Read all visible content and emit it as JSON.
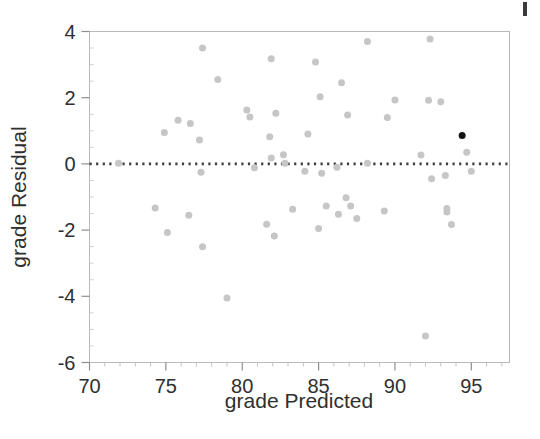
{
  "chart_data": {
    "type": "scatter",
    "title": "",
    "xlabel": "grade Predicted",
    "ylabel": "grade Residual",
    "xlim": [
      70,
      97.5
    ],
    "ylim": [
      -6,
      4
    ],
    "xticks": [
      70,
      75,
      80,
      85,
      90,
      95
    ],
    "xtick_labels": [
      "70",
      "75",
      "80",
      "85",
      "90",
      "95"
    ],
    "yticks": [
      -6,
      -4,
      -2,
      0,
      2,
      4
    ],
    "ytick_labels": [
      "-6",
      "-4",
      "-2",
      "0",
      "2",
      "4"
    ],
    "x_minor_tick_step": 1,
    "y_minor_tick_step": 0.5,
    "grid": false,
    "legend": null,
    "reference_line": {
      "kind": "horizontal-dotted",
      "y": 0,
      "style": "dotted",
      "color": "#3d3d3d"
    },
    "marker": {
      "shape": "circle",
      "size_px": 7,
      "default_color": "#c6c6c6",
      "highlight_color": "#141414"
    },
    "series": [
      {
        "name": "residuals",
        "color": "#c6c6c6",
        "points": [
          [
            71.9,
            0.02
          ],
          [
            74.3,
            -1.33
          ],
          [
            74.9,
            0.95
          ],
          [
            75.1,
            -2.07
          ],
          [
            75.8,
            1.32
          ],
          [
            76.5,
            -1.55
          ],
          [
            76.6,
            1.22
          ],
          [
            77.2,
            0.72
          ],
          [
            77.3,
            -0.25
          ],
          [
            77.4,
            3.5
          ],
          [
            77.4,
            -2.5
          ],
          [
            78.4,
            2.55
          ],
          [
            79.0,
            -4.05
          ],
          [
            80.3,
            1.63
          ],
          [
            80.5,
            1.42
          ],
          [
            80.8,
            -0.12
          ],
          [
            81.6,
            -1.82
          ],
          [
            81.9,
            3.18
          ],
          [
            81.9,
            0.18
          ],
          [
            81.8,
            0.82
          ],
          [
            82.1,
            -2.18
          ],
          [
            82.2,
            1.53
          ],
          [
            82.7,
            0.28
          ],
          [
            82.8,
            0.02
          ],
          [
            83.3,
            -1.37
          ],
          [
            84.1,
            -0.22
          ],
          [
            84.3,
            0.9
          ],
          [
            84.8,
            3.08
          ],
          [
            85.0,
            -1.95
          ],
          [
            85.1,
            2.03
          ],
          [
            85.2,
            -0.28
          ],
          [
            85.5,
            -1.27
          ],
          [
            86.2,
            -0.1
          ],
          [
            86.3,
            -1.52
          ],
          [
            86.5,
            2.45
          ],
          [
            86.8,
            -1.02
          ],
          [
            86.9,
            1.48
          ],
          [
            87.1,
            -1.27
          ],
          [
            87.5,
            -1.65
          ],
          [
            88.2,
            3.7
          ],
          [
            88.2,
            0.02
          ],
          [
            89.3,
            -1.42
          ],
          [
            89.5,
            1.4
          ],
          [
            90.0,
            1.93
          ],
          [
            91.7,
            0.27
          ],
          [
            92.2,
            1.92
          ],
          [
            92.3,
            3.77
          ],
          [
            92.4,
            -0.45
          ],
          [
            92.0,
            -5.2
          ],
          [
            93.0,
            1.88
          ],
          [
            93.3,
            -0.35
          ],
          [
            93.4,
            -1.35
          ],
          [
            93.4,
            -1.45
          ],
          [
            93.7,
            -1.83
          ],
          [
            94.7,
            0.35
          ],
          [
            95.0,
            -0.22
          ]
        ]
      },
      {
        "name": "highlighted-point",
        "color": "#141414",
        "points": [
          [
            94.4,
            0.86
          ]
        ]
      }
    ]
  }
}
